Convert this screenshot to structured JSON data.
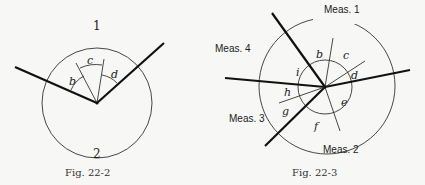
{
  "figures": [
    {
      "caption": "Fig. 22-2",
      "region_labels": [
        "1",
        "2"
      ],
      "angle_labels": [
        "b",
        "c",
        "d"
      ]
    },
    {
      "caption": "Fig. 22-3",
      "measurement_labels": [
        "Meas. 1",
        "Meas. 2",
        "Meas. 3",
        "Meas. 4"
      ],
      "angle_labels": [
        "b",
        "c",
        "d",
        "e",
        "f",
        "g",
        "h",
        "i"
      ]
    }
  ]
}
